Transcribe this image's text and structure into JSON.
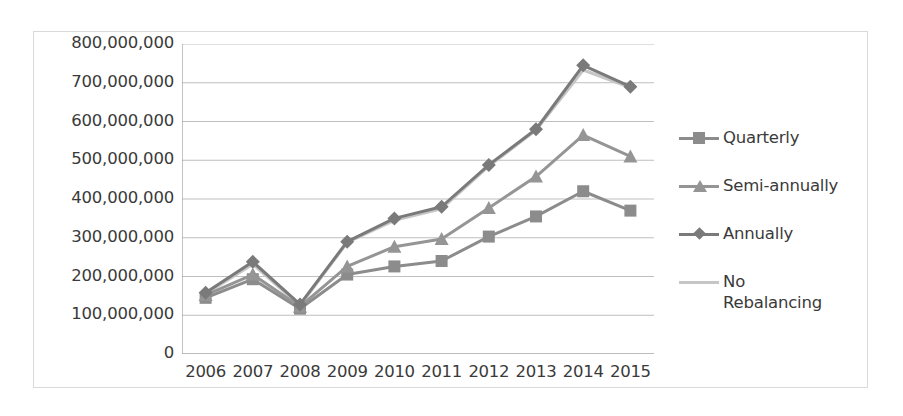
{
  "chart_data": {
    "type": "line",
    "title": "",
    "xlabel": "",
    "ylabel": "",
    "categories": [
      "2006",
      "2007",
      "2008",
      "2009",
      "2010",
      "2011",
      "2012",
      "2013",
      "2014",
      "2015"
    ],
    "ylim": [
      0,
      800000000
    ],
    "ytick_step": 100000000,
    "ytick_labels": [
      "800,000,000",
      "700,000,000",
      "600,000,000",
      "500,000,000",
      "400,000,000",
      "300,000,000",
      "200,000,000",
      "100,000,000",
      "0"
    ],
    "ytick_values": [
      800000000,
      700000000,
      600000000,
      500000000,
      400000000,
      300000000,
      200000000,
      100000000,
      0
    ],
    "grid": "horizontal",
    "legend_position": "right",
    "series": [
      {
        "name": "Quarterly",
        "marker": "square",
        "color": "#8c8c8c",
        "values": [
          145000000,
          193000000,
          117000000,
          205000000,
          226000000,
          240000000,
          303000000,
          355000000,
          420000000,
          370000000
        ]
      },
      {
        "name": "Semi-annually",
        "marker": "triangle",
        "color": "#959595",
        "values": [
          152000000,
          205000000,
          122000000,
          226000000,
          277000000,
          297000000,
          377000000,
          458000000,
          565000000,
          510000000
        ]
      },
      {
        "name": "Annually",
        "marker": "diamond",
        "color": "#7a7a7a",
        "values": [
          158000000,
          238000000,
          128000000,
          290000000,
          350000000,
          380000000,
          488000000,
          580000000,
          745000000,
          690000000
        ]
      },
      {
        "name": "No\nRebalancing",
        "marker": "none",
        "color": "#c6c6c6",
        "values": [
          156000000,
          232000000,
          125000000,
          288000000,
          345000000,
          375000000,
          485000000,
          578000000,
          733000000,
          688000000
        ]
      }
    ]
  },
  "legend": {
    "entries": [
      {
        "label": "Quarterly"
      },
      {
        "label": "Semi-annually"
      },
      {
        "label": "Annually"
      },
      {
        "label": "No\nRebalancing"
      }
    ]
  },
  "colors": {
    "border": "#d9d9d9",
    "gridline": "#bfbfbf",
    "axis": "#9a9a9a",
    "text": "#3a3a3a"
  }
}
